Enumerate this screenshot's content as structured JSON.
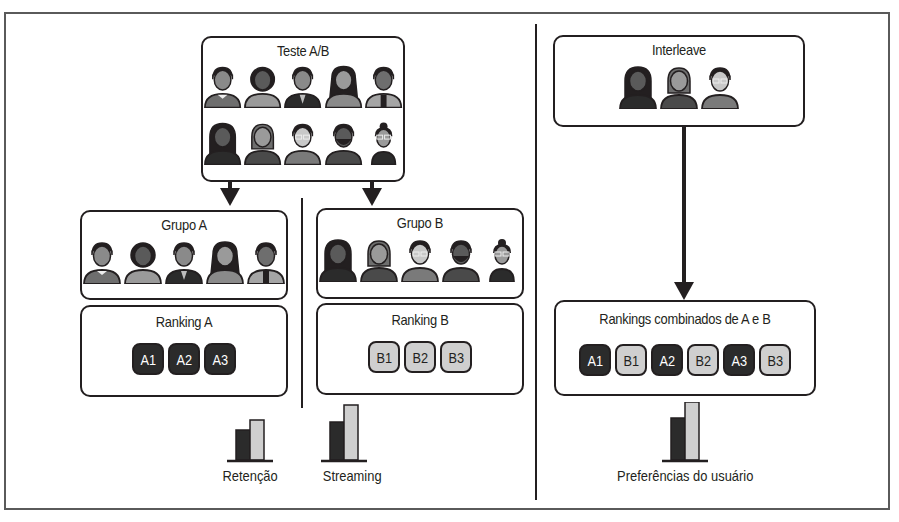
{
  "ab_test": {
    "title": "Teste A/B",
    "row1": [
      {
        "hair": "#231f20",
        "skin": "#8a8a8a",
        "shirt": "#6e6e6e",
        "style": "collar"
      },
      {
        "hair": "#231f20",
        "skin": "#5a5a5a",
        "shirt": "#9a9a9a",
        "style": "afro"
      },
      {
        "hair": "#231f20",
        "skin": "#8a8a8a",
        "shirt": "#2b2b2b",
        "style": "suit"
      },
      {
        "hair": "#231f20",
        "skin": "#9a9a9a",
        "shirt": "#8a8a8a",
        "style": "longhair"
      },
      {
        "hair": "#231f20",
        "skin": "#6e6e6e",
        "shirt": "#a5a5a5",
        "style": "vest"
      }
    ],
    "row2": [
      {
        "hair": "#231f20",
        "skin": "#5a5a5a",
        "shirt": "#2b2b2b",
        "style": "hood"
      },
      {
        "hair": "#6e6e6e",
        "skin": "#9a9a9a",
        "shirt": "#4a4a4a",
        "style": "bob"
      },
      {
        "hair": "#231f20",
        "skin": "#c8c8c8",
        "shirt": "#7a7a7a",
        "style": "glasses"
      },
      {
        "hair": "#231f20",
        "skin": "#5a5a5a",
        "shirt": "#4a4a4a",
        "style": "beard"
      },
      {
        "hair": "#231f20",
        "skin": "#9a9a9a",
        "shirt": "#2b2b2b",
        "style": "bun"
      }
    ]
  },
  "group_a": {
    "title": "Grupo A"
  },
  "group_b": {
    "title": "Grupo B"
  },
  "ranking_a": {
    "title": "Ranking A",
    "items": [
      "A1",
      "A2",
      "A3"
    ]
  },
  "ranking_b": {
    "title": "Ranking B",
    "items": [
      "B1",
      "B2",
      "B3"
    ]
  },
  "interleave": {
    "title": "Interleave"
  },
  "combined": {
    "title": "Rankings combinados de A e B",
    "items": [
      {
        "label": "A1",
        "variant": "dark"
      },
      {
        "label": "B1",
        "variant": "light"
      },
      {
        "label": "A2",
        "variant": "dark"
      },
      {
        "label": "B2",
        "variant": "light"
      },
      {
        "label": "A3",
        "variant": "dark"
      },
      {
        "label": "B3",
        "variant": "light"
      }
    ]
  },
  "metrics": {
    "retention": {
      "label": "Retenção",
      "bars": [
        30,
        40
      ]
    },
    "streaming": {
      "label": "Streaming",
      "bars": [
        38,
        55
      ]
    },
    "preferences": {
      "label": "Preferências do usuário",
      "bars": [
        42,
        58
      ]
    }
  },
  "colors": {
    "dark_chip": "#2b2b2b",
    "light_chip": "#cfcfcf",
    "line": "#231f20"
  }
}
